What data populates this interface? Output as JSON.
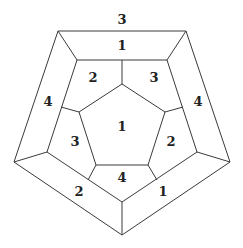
{
  "diagram": {
    "type": "dodecahedron-schlegel-coloring",
    "colors": {
      "stroke": "#3a3a3a",
      "label": "#222222",
      "background": "#ffffff"
    },
    "vertices": {
      "outer": [
        [
          58,
          31
        ],
        [
          186,
          31
        ],
        [
          230,
          162
        ],
        [
          122,
          235
        ],
        [
          14,
          162
        ]
      ],
      "middle": [
        [
          77,
          60
        ],
        [
          167,
          60
        ],
        [
          197,
          152
        ],
        [
          122,
          202
        ],
        [
          47,
          152
        ]
      ],
      "inner": [
        [
          122,
          84
        ],
        [
          165,
          112
        ],
        [
          148,
          165
        ],
        [
          96,
          165
        ],
        [
          79,
          112
        ]
      ]
    },
    "labels": {
      "outer_top": "3",
      "top_face": "1",
      "left_outer": "4",
      "right_outer": "4",
      "upper_left": "2",
      "upper_right": "3",
      "center": "1",
      "lower_left": "3",
      "lower_right": "2",
      "bottom_inner": "4",
      "bottom_left": "2",
      "bottom_right": "1"
    }
  }
}
